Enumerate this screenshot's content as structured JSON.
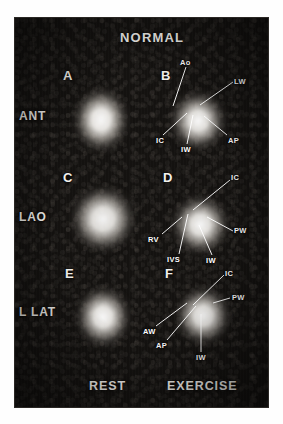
{
  "figure": {
    "title": "NORMAL",
    "column_labels": [
      {
        "label": "REST"
      },
      {
        "label": "EXERCISE"
      }
    ],
    "row_labels": [
      {
        "label": "ANT"
      },
      {
        "label": "LAO"
      },
      {
        "label": "L LAT"
      }
    ],
    "panels": [
      {
        "letter": "A",
        "view": "ANT",
        "condition": "REST",
        "annotations": []
      },
      {
        "letter": "B",
        "view": "ANT",
        "condition": "EXERCISE",
        "annotations": [
          {
            "label": "Ao"
          },
          {
            "label": "LW"
          },
          {
            "label": "IC"
          },
          {
            "label": "IW"
          },
          {
            "label": "AP"
          }
        ]
      },
      {
        "letter": "C",
        "view": "LAO",
        "condition": "REST",
        "annotations": []
      },
      {
        "letter": "D",
        "view": "LAO",
        "condition": "EXERCISE",
        "annotations": [
          {
            "label": "IC"
          },
          {
            "label": "PW"
          },
          {
            "label": "RV"
          },
          {
            "label": "IVS"
          },
          {
            "label": "IW"
          }
        ]
      },
      {
        "letter": "E",
        "view": "L LAT",
        "condition": "REST",
        "annotations": []
      },
      {
        "letter": "F",
        "view": "L LAT",
        "condition": "EXERCISE",
        "annotations": [
          {
            "label": "IC"
          },
          {
            "label": "PW"
          },
          {
            "label": "AW"
          },
          {
            "label": "AP"
          },
          {
            "label": "IW"
          }
        ]
      }
    ],
    "colors": {
      "plate_background": "#141210",
      "text": "#f2f0ec",
      "leader_line": "#ffffff",
      "uptake_core": "#ffffff",
      "page_background": "#fefefe"
    }
  }
}
